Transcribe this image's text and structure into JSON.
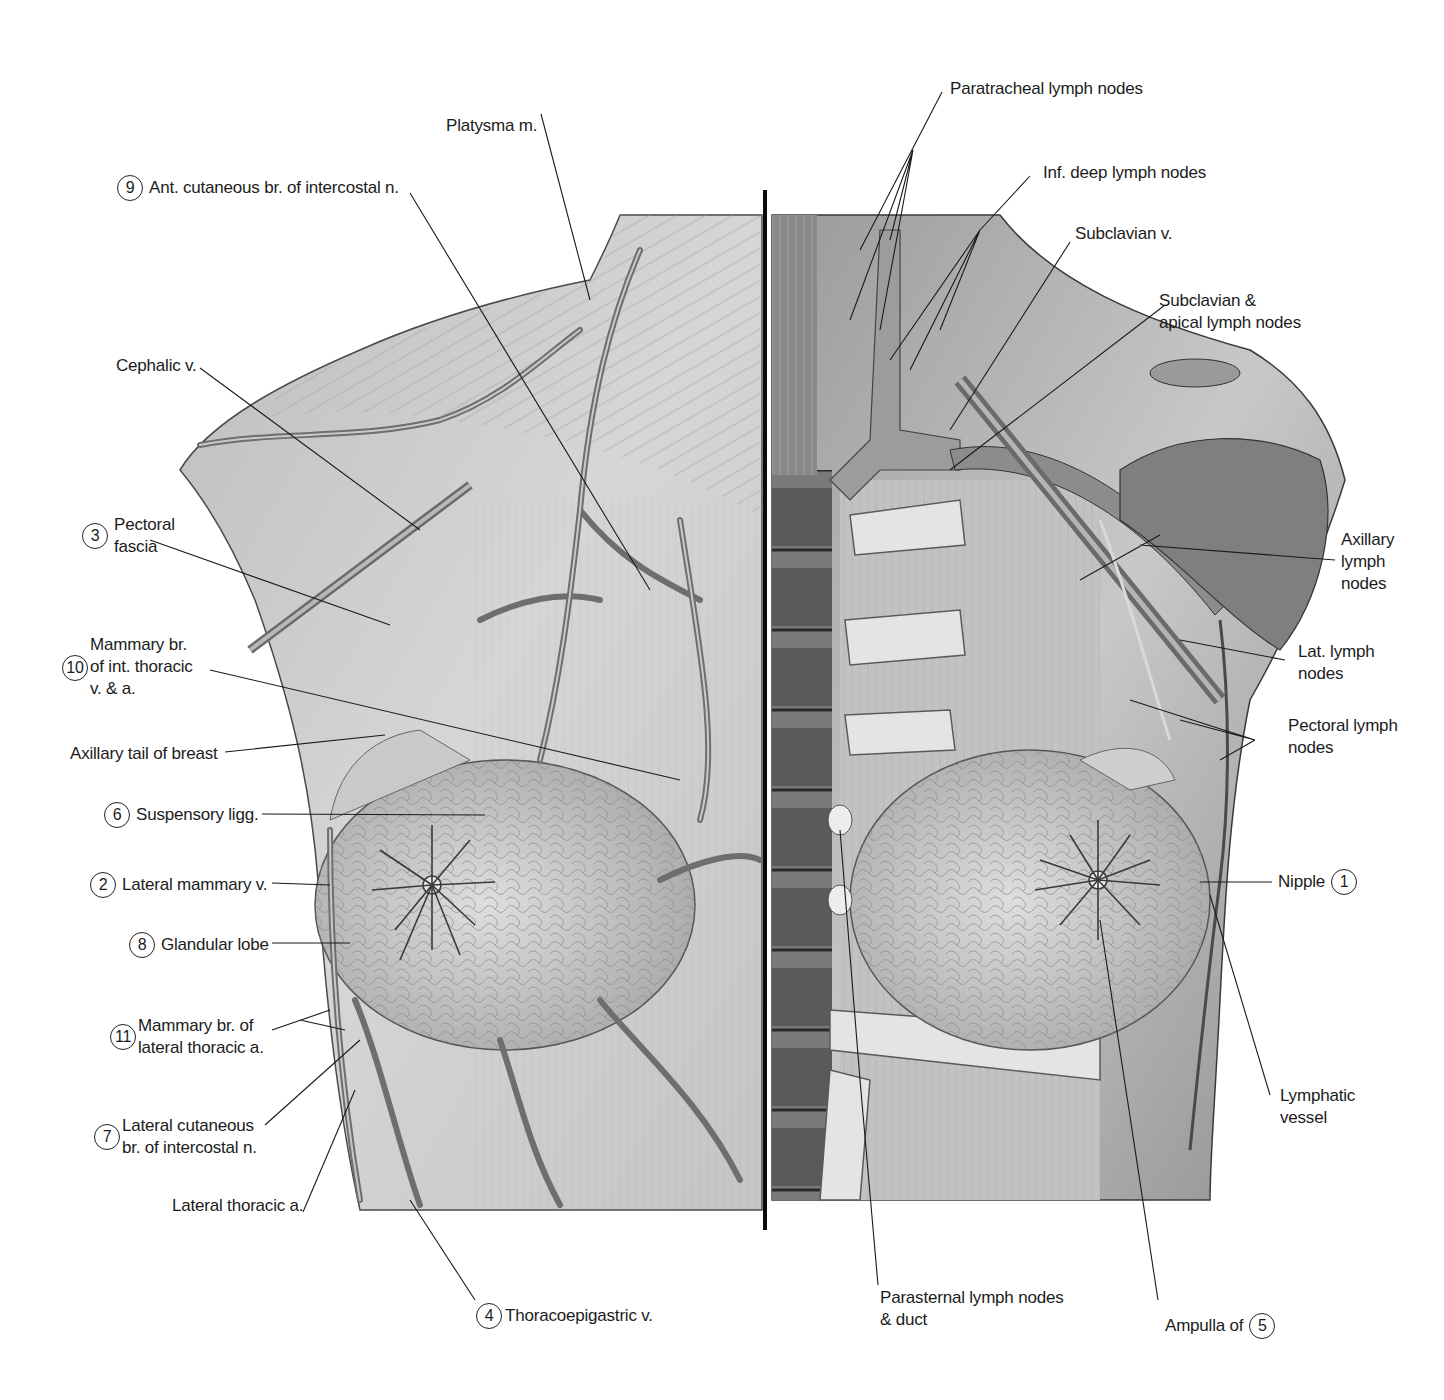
{
  "figure": {
    "colors": {
      "background": "#ffffff",
      "tissue_light": "#d8d8d8",
      "tissue_mid": "#a9a9a9",
      "tissue_dark": "#5e5e5e",
      "vessel": "#7d7d7d",
      "line": "#1a1a1a",
      "divider": "#0a0a0a"
    },
    "divider_x": 765
  },
  "labels_left": [
    {
      "id": "platysma",
      "number": null,
      "lines": [
        "Platysma m."
      ]
    },
    {
      "id": "ant-cutaneous",
      "number": "9",
      "lines": [
        "Ant. cutaneous br. of intercostal n."
      ]
    },
    {
      "id": "cephalic",
      "number": null,
      "lines": [
        "Cephalic v."
      ]
    },
    {
      "id": "pectoral-fascia",
      "number": "3",
      "lines": [
        "Pectoral",
        "fascia"
      ]
    },
    {
      "id": "mammary-int-thoracic",
      "number": "10",
      "lines": [
        "Mammary br.",
        "of int. thoracic",
        "v. & a."
      ]
    },
    {
      "id": "axillary-tail",
      "number": null,
      "lines": [
        "Axillary tail of breast"
      ]
    },
    {
      "id": "suspensory",
      "number": "6",
      "lines": [
        "Suspensory ligg."
      ]
    },
    {
      "id": "lateral-mammary",
      "number": "2",
      "lines": [
        "Lateral mammary v."
      ]
    },
    {
      "id": "glandular-lobe",
      "number": "8",
      "lines": [
        "Glandular lobe"
      ]
    },
    {
      "id": "mammary-lat-thoracic",
      "number": "11",
      "lines": [
        "Mammary br. of",
        "lateral thoracic a."
      ]
    },
    {
      "id": "lat-cutaneous",
      "number": "7",
      "lines": [
        "Lateral cutaneous",
        "br. of intercostal n."
      ]
    },
    {
      "id": "lateral-thoracic",
      "number": null,
      "lines": [
        "Lateral thoracic a."
      ]
    },
    {
      "id": "thoracoepigastric",
      "number": "4",
      "lines": [
        "Thoracoepigastric v."
      ]
    }
  ],
  "labels_right": [
    {
      "id": "paratracheal",
      "number": null,
      "lines": [
        "Paratracheal lymph nodes"
      ]
    },
    {
      "id": "inf-deep",
      "number": null,
      "lines": [
        "Inf. deep lymph nodes"
      ]
    },
    {
      "id": "subclavian-v",
      "number": null,
      "lines": [
        "Subclavian v."
      ]
    },
    {
      "id": "subclavian-apical",
      "number": null,
      "lines": [
        "Subclavian &",
        "apical lymph nodes"
      ]
    },
    {
      "id": "axillary-nodes",
      "number": null,
      "lines": [
        "Axillary",
        "lymph",
        "nodes"
      ]
    },
    {
      "id": "lat-nodes",
      "number": null,
      "lines": [
        "Lat. lymph",
        "nodes"
      ]
    },
    {
      "id": "pectoral-nodes",
      "number": null,
      "lines": [
        "Pectoral lymph",
        "nodes"
      ]
    },
    {
      "id": "nipple",
      "number": "1",
      "lines": [
        "Nipple"
      ]
    },
    {
      "id": "lymphatic-vessel",
      "number": null,
      "lines": [
        "Lymphatic",
        "vessel"
      ]
    },
    {
      "id": "parasternal",
      "number": null,
      "lines": [
        "Parasternal lymph nodes",
        "& duct"
      ]
    },
    {
      "id": "ampulla",
      "number": "5",
      "lines": [
        "Ampulla of"
      ]
    }
  ]
}
